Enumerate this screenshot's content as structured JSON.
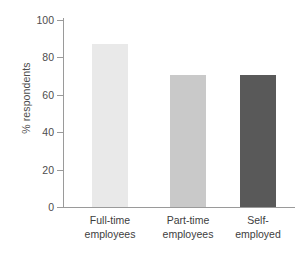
{
  "chart_data": {
    "type": "bar",
    "title": "",
    "xlabel": "",
    "ylabel": "% respondents",
    "categories": [
      "Full-time employees",
      "Part-time employees",
      "Self-employed"
    ],
    "category_lines": [
      [
        "Full-time",
        "employees"
      ],
      [
        "Part-time",
        "employees"
      ],
      [
        "Self-",
        "employed"
      ]
    ],
    "values": [
      87,
      70.5,
      70.5
    ],
    "ylim": [
      0,
      100
    ],
    "yticks": [
      0,
      20,
      40,
      60,
      80,
      100
    ],
    "ytick_labels": [
      "0",
      "20",
      "40",
      "60",
      "80",
      "100"
    ],
    "grid": false,
    "legend": false,
    "bar_colors": [
      "#e9e9e9",
      "#c9c9c9",
      "#595959"
    ],
    "axis_color": "#9a9a9a",
    "text_color": "#4d4d4d",
    "background": "#ffffff"
  }
}
